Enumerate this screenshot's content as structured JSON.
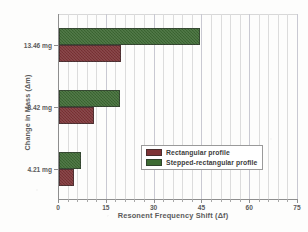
{
  "chart_data": {
    "type": "bar",
    "orientation": "horizontal",
    "title": "",
    "xlabel": "Resonent Frequency Shift (Δf)",
    "ylabel": "Change in Mass (Δm)",
    "categories": [
      "4.21 mg",
      "8.42 mg",
      "13.46 mg"
    ],
    "series": [
      {
        "name": "Rectangular profile",
        "color": "#7e3336",
        "values": [
          4.7,
          10.9,
          19.3
        ]
      },
      {
        "name": "Stepped-rectangular profile",
        "color": "#3d6b33",
        "values": [
          7.0,
          19.0,
          44.4
        ]
      }
    ],
    "xlim": [
      0,
      75
    ],
    "xticks": [
      0,
      15,
      30,
      45,
      60,
      75
    ],
    "xticklabels": [
      "0",
      "15",
      "30",
      "45",
      "60",
      "75"
    ],
    "minor_tick_interval": 3,
    "grid": "vertical-light",
    "legend_position": "lower-right-inside"
  }
}
